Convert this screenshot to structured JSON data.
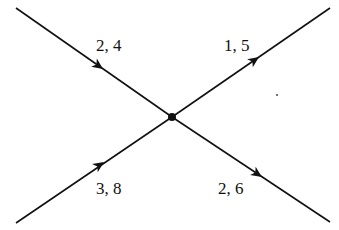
{
  "diagram": {
    "type": "crossing-edges",
    "center_node": "junction",
    "edges": [
      {
        "id": "top-left",
        "direction": "into-center",
        "label": "2, 4"
      },
      {
        "id": "bottom-left",
        "direction": "into-center",
        "label": "3, 8"
      },
      {
        "id": "top-right",
        "direction": "out-of-center",
        "label": "1, 5"
      },
      {
        "id": "bottom-right",
        "direction": "out-of-center",
        "label": "2, 6"
      }
    ]
  }
}
